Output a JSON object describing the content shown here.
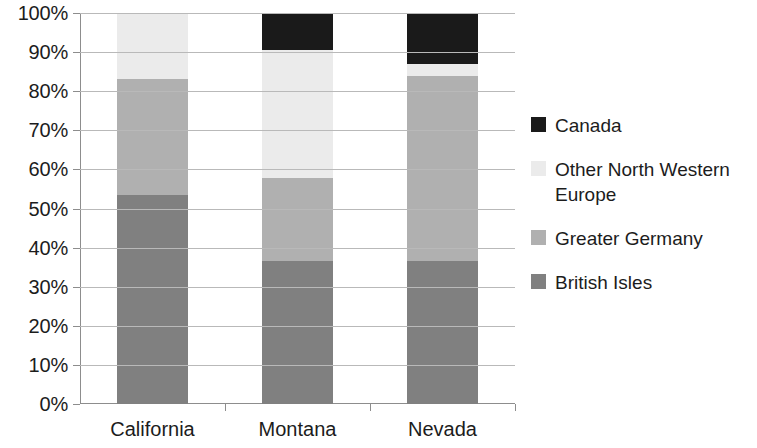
{
  "chart_data": {
    "type": "bar",
    "subtype": "stacked-100-percent",
    "title": "",
    "xlabel": "",
    "ylabel": "",
    "ylim": [
      0,
      100
    ],
    "y_tick_labels": [
      "0%",
      "10%",
      "20%",
      "30%",
      "40%",
      "50%",
      "60%",
      "70%",
      "80%",
      "90%",
      "100%"
    ],
    "y_tick_values": [
      0,
      10,
      20,
      30,
      40,
      50,
      60,
      70,
      80,
      90,
      100
    ],
    "grid": true,
    "legend_position": "right",
    "categories": [
      "California",
      "Montana",
      "Nevada"
    ],
    "series": [
      {
        "name": "British Isles",
        "color": "#808080",
        "values": [
          53.4,
          36.6,
          36.6
        ]
      },
      {
        "name": "Greater Germany",
        "color": "#b0b0b0",
        "values": [
          29.6,
          21.2,
          47.4
        ]
      },
      {
        "name": "Other North Western Europe",
        "color": "#ebebeb",
        "values": [
          17.0,
          32.7,
          3.0
        ]
      },
      {
        "name": "Canada",
        "color": "#1a1a1a",
        "values": [
          0.0,
          9.5,
          13.0
        ]
      }
    ],
    "stack_order_bottom_to_top": [
      "British Isles",
      "Greater Germany",
      "Other North Western Europe",
      "Canada"
    ],
    "cumulative_tops": {
      "California": {
        "British Isles": 53.4,
        "Greater Germany": 83.0,
        "Other North Western Europe": 100.0,
        "Canada": 100.0
      },
      "Montana": {
        "British Isles": 36.6,
        "Greater Germany": 57.8,
        "Other North Western Europe": 90.5,
        "Canada": 100.0
      },
      "Nevada": {
        "British Isles": 36.6,
        "Greater Germany": 84.0,
        "Other North Western Europe": 87.0,
        "Canada": 100.0
      }
    }
  },
  "legend": {
    "items": [
      {
        "label": "Canada",
        "color": "#1a1a1a"
      },
      {
        "label": "Other North Western Europe",
        "color": "#ebebeb"
      },
      {
        "label": "Greater Germany",
        "color": "#b0b0b0"
      },
      {
        "label": "British Isles",
        "color": "#808080"
      }
    ]
  },
  "axes": {
    "grid_color": "#b9b9b9",
    "axis_color": "#8d8d8d"
  }
}
